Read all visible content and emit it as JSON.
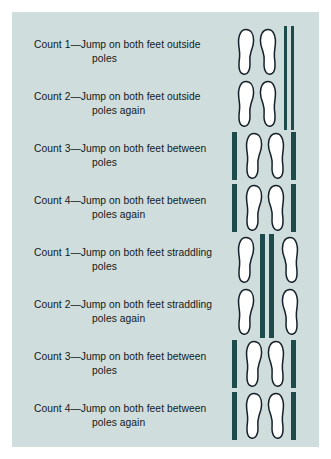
{
  "figure": {
    "panel_background": "#cfdedc",
    "pole_color": "#1d4a4a",
    "foot_fill": "#ffffff",
    "foot_outline": "#16202a",
    "page_background": "#ffffff"
  },
  "rows": [
    {
      "line1": "Count 1—Jump on both feet outside",
      "line2": "poles",
      "config": "outside",
      "feet": 2,
      "poles": 2
    },
    {
      "line1": "Count 2—Jump on both feet outside",
      "line2": "poles again",
      "config": "outside",
      "feet": 2,
      "poles": 2
    },
    {
      "line1": "Count 3—Jump on both feet between",
      "line2": "poles",
      "config": "between",
      "feet": 2,
      "poles": 2
    },
    {
      "line1": "Count 4—Jump on both feet between",
      "line2": "poles again",
      "config": "between",
      "feet": 2,
      "poles": 2
    },
    {
      "line1": "Count 1—Jump on both feet straddling",
      "line2": "poles",
      "config": "straddling",
      "feet": 2,
      "poles": 2
    },
    {
      "line1": "Count 2—Jump on both feet straddling",
      "line2": "poles again",
      "config": "straddling",
      "feet": 2,
      "poles": 2
    },
    {
      "line1": "Count 3—Jump on both feet between",
      "line2": "poles",
      "config": "between",
      "feet": 2,
      "poles": 2
    },
    {
      "line1": "Count 4—Jump on both feet between",
      "line2": "poles again",
      "config": "between",
      "feet": 2,
      "poles": 2
    }
  ]
}
